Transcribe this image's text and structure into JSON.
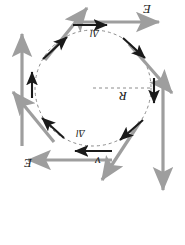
{
  "figure": {
    "type": "physics-vector-diagram",
    "orientation_degrees": 180,
    "canvas": {
      "width": 185,
      "height": 245
    },
    "colors": {
      "background": "#ffffff",
      "gray_vector": "#9e9e9e",
      "black_vector": "#1a1a1a",
      "dashed_circle": "#8c8c8c",
      "label_text": "#1a1a1a"
    },
    "circle": {
      "cx": 93,
      "cy": 88,
      "r": 58,
      "stroke_dash": "3 3"
    },
    "radius_line": {
      "x1": 93,
      "y1": 88,
      "x2": 151,
      "y2": 88,
      "stroke_dash": "3 3"
    },
    "labels": [
      {
        "id": "E-top",
        "text": "E",
        "x": 143,
        "y": 4,
        "rotated": true
      },
      {
        "id": "E-bottom",
        "text": "E",
        "x": 24,
        "y": 158,
        "rotated": true
      },
      {
        "id": "R",
        "text": "R",
        "x": 120,
        "y": 92,
        "rotated": true
      },
      {
        "id": "v",
        "text": "v",
        "x": 95,
        "y": 157,
        "rotated": true
      },
      {
        "id": "dl-top",
        "text": "Δl",
        "x": 93,
        "y": 30,
        "rotated": true
      },
      {
        "id": "dl-bottom",
        "text": "Δl",
        "x": 78,
        "y": 130,
        "rotated": true
      }
    ],
    "gray_vectors": [
      {
        "id": "gray-up-left",
        "x1": 22,
        "y1": 148,
        "x2": 22,
        "y2": 33
      },
      {
        "id": "gray-up-right",
        "x1": 43,
        "y1": 61,
        "x2": 86,
        "y2": 6
      },
      {
        "id": "gray-right-top",
        "x1": 72,
        "y1": 22,
        "x2": 161,
        "y2": 22
      },
      {
        "id": "gray-down-right",
        "x1": 128,
        "y1": 42,
        "x2": 174,
        "y2": 94
      },
      {
        "id": "gray-down",
        "x1": 163,
        "y1": 87,
        "x2": 163,
        "y2": 193
      },
      {
        "id": "gray-down-left",
        "x1": 141,
        "y1": 120,
        "x2": 100,
        "y2": 182
      },
      {
        "id": "gray-left",
        "x1": 113,
        "y1": 160,
        "x2": 26,
        "y2": 160
      },
      {
        "id": "gray-up-left-2",
        "x1": 53,
        "y1": 143,
        "x2": 11,
        "y2": 91
      }
    ],
    "black_tangent_vectors": [
      {
        "id": "tan-top",
        "x1": 72,
        "y1": 25,
        "x2": 108,
        "y2": 25
      },
      {
        "id": "tan-top-right",
        "x1": 122,
        "y1": 37,
        "x2": 146,
        "y2": 59
      },
      {
        "id": "tan-right",
        "x1": 155,
        "y1": 77,
        "x2": 155,
        "y2": 104
      },
      {
        "id": "tan-bot-right",
        "x1": 144,
        "y1": 119,
        "x2": 119,
        "y2": 141
      },
      {
        "id": "tan-bottom",
        "x1": 113,
        "y1": 151,
        "x2": 74,
        "y2": 151
      },
      {
        "id": "tan-bot-left",
        "x1": 65,
        "y1": 139,
        "x2": 41,
        "y2": 117
      },
      {
        "id": "tan-left",
        "x1": 32,
        "y1": 99,
        "x2": 32,
        "y2": 71
      },
      {
        "id": "tan-top-left",
        "x1": 42,
        "y1": 58,
        "x2": 68,
        "y2": 36
      }
    ]
  }
}
